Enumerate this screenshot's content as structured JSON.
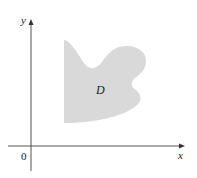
{
  "figure": {
    "axes": {
      "x_label": "x",
      "y_label": "y",
      "origin_label": "0",
      "axis_color": "#555555"
    },
    "region": {
      "label": "D",
      "fill_color": "#d9d9d9",
      "description": "Irregular shaded plane region bounded on left by a vertical segment"
    }
  }
}
